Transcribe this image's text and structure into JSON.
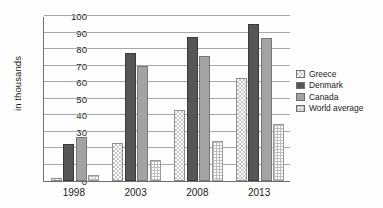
{
  "chart_data": {
    "type": "bar",
    "title": "",
    "xlabel": "",
    "ylabel": "in thousands",
    "categories": [
      "1998",
      "2003",
      "2008",
      "2013"
    ],
    "series": [
      {
        "name": "Greece",
        "values": [
          2,
          23,
          43,
          62.5
        ],
        "color": "#c4c4c4",
        "pattern": "checkerboard"
      },
      {
        "name": "Denmark",
        "values": [
          22.5,
          77.5,
          87,
          95
        ],
        "color": "#565656",
        "pattern": "solid"
      },
      {
        "name": "Canada",
        "values": [
          26.5,
          70,
          76,
          86.5
        ],
        "color": "#a3a3a3",
        "pattern": "solid"
      },
      {
        "name": "World average",
        "values": [
          3.5,
          13,
          24.5,
          34.5
        ],
        "color": "#ffffff",
        "pattern": "grid-dots"
      }
    ],
    "ylim": [
      0,
      100
    ],
    "yticks": [
      0,
      10,
      20,
      30,
      40,
      50,
      60,
      70,
      80,
      90,
      100
    ],
    "ytick_labels": [
      "0",
      "10",
      "20",
      "30",
      "40",
      "50",
      "60",
      "70",
      "80",
      "90",
      "100"
    ],
    "grid": true,
    "legend_position": "right"
  },
  "legend": {
    "items": [
      {
        "label": "Greece"
      },
      {
        "label": "Denmark"
      },
      {
        "label": "Canada"
      },
      {
        "label": "World average"
      }
    ]
  }
}
